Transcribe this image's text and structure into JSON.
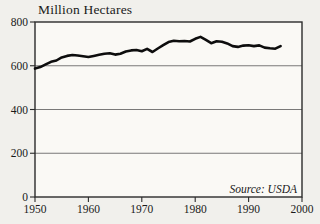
{
  "chart": {
    "title": "Million Hectares",
    "source_note": "Source: USDA",
    "colors": {
      "background": "#f1f0ec",
      "plot_background": "#faf9f5",
      "line": "#0d0d0d",
      "grid": "#6a6a6a",
      "frame": "#2b2b2b",
      "text": "#1a1a1a"
    }
  },
  "chart_data": {
    "type": "line",
    "title": "Million Hectares",
    "source": "Source: USDA",
    "xlabel": "",
    "ylabel": "Million Hectares",
    "xlim": [
      1950,
      2000
    ],
    "ylim": [
      0,
      800
    ],
    "xticks": [
      1950,
      1960,
      1970,
      1980,
      1990,
      2000
    ],
    "yticks": [
      0,
      200,
      400,
      600,
      800
    ],
    "grid": "horizontal lines at 200, 400, 600",
    "legend": "none",
    "x": [
      1950,
      1951,
      1952,
      1953,
      1954,
      1955,
      1956,
      1957,
      1958,
      1959,
      1960,
      1961,
      1962,
      1963,
      1964,
      1965,
      1966,
      1967,
      1968,
      1969,
      1970,
      1971,
      1972,
      1973,
      1974,
      1975,
      1976,
      1977,
      1978,
      1979,
      1980,
      1981,
      1982,
      1983,
      1984,
      1985,
      1986,
      1987,
      1988,
      1989,
      1990,
      1991,
      1992,
      1993,
      1994,
      1995,
      1996
    ],
    "values": [
      587,
      594,
      606,
      618,
      624,
      638,
      645,
      649,
      647,
      643,
      640,
      645,
      650,
      655,
      657,
      651,
      655,
      665,
      670,
      672,
      666,
      677,
      663,
      679,
      694,
      708,
      714,
      712,
      713,
      711,
      723,
      732,
      718,
      703,
      712,
      710,
      702,
      690,
      686,
      692,
      694,
      690,
      693,
      683,
      680,
      678,
      690
    ]
  }
}
